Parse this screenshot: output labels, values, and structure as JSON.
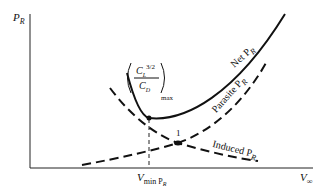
{
  "diagram": {
    "y_axis_label": "P",
    "y_axis_label_sub": "R",
    "x_axis_label": "V",
    "x_axis_label_sub": "∞",
    "curves": {
      "net": {
        "label": "Net P",
        "sub": "R",
        "style": "solid"
      },
      "parasite": {
        "label": "Parasite P",
        "sub": "R",
        "style": "dashed"
      },
      "induced": {
        "label": "Induced P",
        "sub": "R",
        "style": "dashed"
      }
    },
    "annotation_min": {
      "numerator": "C",
      "numerator_sub": "L",
      "numerator_sup": "3/2",
      "denominator": "C",
      "denominator_sub": "D",
      "suffix": "max"
    },
    "intersection_label": "1",
    "vmin_label": "V",
    "vmin_sub": "min P",
    "vmin_sub2": "R",
    "line_color": "#111111"
  }
}
